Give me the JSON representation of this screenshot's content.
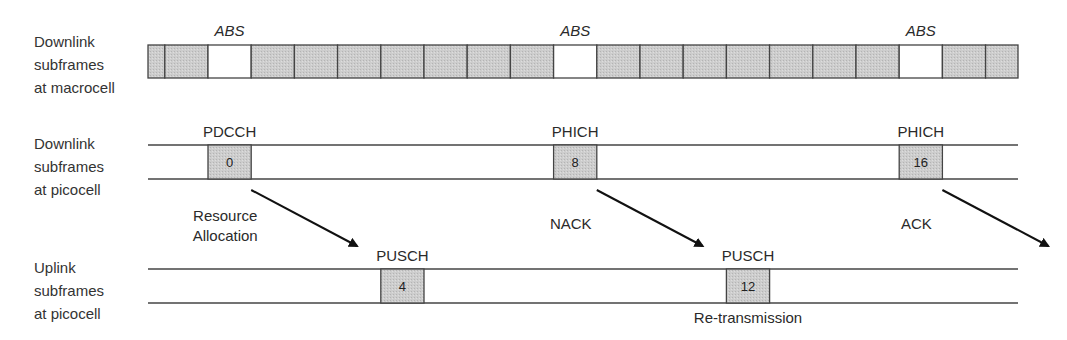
{
  "diagram": {
    "rows": [
      {
        "id": "macro-downlink",
        "label_lines": [
          "Downlink",
          "subframes",
          "at macrocell"
        ],
        "subframe_count": 20,
        "abs_subframes": [
          1,
          9,
          17
        ],
        "abs_label": "ABS"
      },
      {
        "id": "pico-downlink",
        "label_lines": [
          "Downlink",
          "subframes",
          "at picocell"
        ],
        "subframes": [
          {
            "index": 0,
            "number": "0",
            "channel": "PDCCH"
          },
          {
            "index": 8,
            "number": "8",
            "channel": "PHICH"
          },
          {
            "index": 16,
            "number": "16",
            "channel": "PHICH"
          }
        ]
      },
      {
        "id": "pico-uplink",
        "label_lines": [
          "Uplink",
          "subframes",
          "at picocell"
        ],
        "subframes": [
          {
            "index": 4,
            "number": "4",
            "channel": "PUSCH"
          },
          {
            "index": 12,
            "number": "12",
            "channel": "PUSCH",
            "note": "Re-transmission"
          }
        ]
      }
    ],
    "arrows": [
      {
        "from_subframe": 0,
        "to_subframe": 4,
        "label_lines": [
          "Resource",
          "Allocation"
        ]
      },
      {
        "from_subframe": 8,
        "to_subframe": 12,
        "label_lines": [
          "NACK"
        ]
      },
      {
        "from_subframe": 16,
        "to_subframe": 20,
        "label_lines": [
          "ACK"
        ]
      }
    ],
    "colors": {
      "filled": "#c8c8c8",
      "empty": "#ffffff",
      "line": "#444444"
    }
  }
}
